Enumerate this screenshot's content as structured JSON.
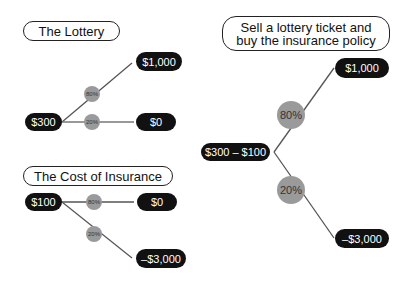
{
  "lottery": {
    "title": "The Lottery",
    "start": "$300",
    "outcomes": [
      {
        "label": "$1,000",
        "probability": "80%"
      },
      {
        "label": "$0",
        "probability": "20%"
      }
    ]
  },
  "insurance": {
    "title": "The Cost of Insurance",
    "start": "$100",
    "outcomes": [
      {
        "label": "$0",
        "probability": "80%"
      },
      {
        "label": "–$3,000",
        "probability": "20%"
      }
    ]
  },
  "combined": {
    "title_line1": "Sell a lottery ticket and",
    "title_line2": "buy the insurance policy",
    "start": "$300 – $100",
    "outcomes": [
      {
        "label": "$1,000",
        "probability": "80%"
      },
      {
        "label": "–$3,000",
        "probability": "20%"
      }
    ]
  },
  "colors": {
    "node_fill": "#111111",
    "probability_circle": "#9a9a9a",
    "line": "#555555"
  }
}
